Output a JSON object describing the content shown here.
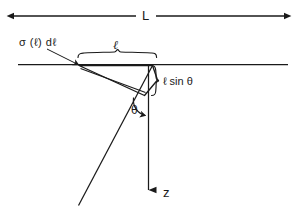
{
  "figure": {
    "background_color": "#ffffff",
    "ink_color": "#1a1a1a",
    "labels": {
      "span_L": "L",
      "crack_density": "σ (ℓ) dℓ",
      "segment_length": "ℓ",
      "vertical_extent": "ℓ sin θ",
      "angle": "θ",
      "depth_axis": "z"
    },
    "elements": {
      "span_arrow": "double-headed-arrow",
      "surface_line": "horizontal-surface-line",
      "slab": "inclined-thin-slab",
      "diagonal": "long-inclined-line",
      "depth_axis_arrow": "downward-arrow",
      "horizontal_brace": "curly-brace-horizontal",
      "vertical_brace": "curly-brace-vertical",
      "angle_arc": "curved-angle-arrow",
      "leader": "leader-line-with-arrow"
    }
  }
}
